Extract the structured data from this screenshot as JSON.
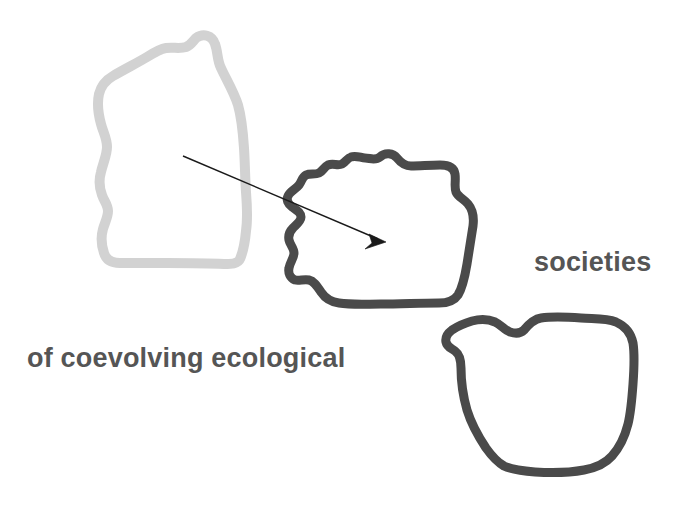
{
  "figure": {
    "background_color": "#ffffff",
    "width": 681,
    "height": 514,
    "labels": {
      "left_text": "of coevolving ecological",
      "right_text": "societies"
    },
    "text_color": "#555555",
    "shapes": [
      {
        "name": "light-blob-outline",
        "role": "faded-ecological-region",
        "stroke_color": "#d2d2d2",
        "stroke_width": 10,
        "fill": "none",
        "bounds": {
          "x": 90,
          "y": 33,
          "width": 160,
          "height": 232
        }
      },
      {
        "name": "dark-blob-center-outline",
        "role": "coevolving-region",
        "stroke_color": "#4a4a4a",
        "stroke_width": 9,
        "fill": "none",
        "bounds": {
          "x": 285,
          "y": 152,
          "width": 192,
          "height": 156
        }
      },
      {
        "name": "dark-blob-lower-right-outline",
        "role": "societies-region",
        "stroke_color": "#4a4a4a",
        "stroke_width": 9,
        "fill": "none",
        "bounds": {
          "x": 450,
          "y": 313,
          "width": 188,
          "height": 170
        }
      }
    ],
    "arrow": {
      "name": "transition-arrow",
      "color": "#1a1a1a",
      "stroke_width": 1.4,
      "start": {
        "x": 183,
        "y": 156
      },
      "end": {
        "x": 385,
        "y": 242
      }
    }
  }
}
